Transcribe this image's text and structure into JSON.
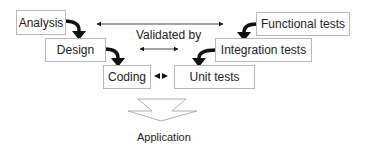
{
  "diagram": {
    "type": "v-model",
    "left_side": [
      {
        "id": "analysis",
        "label": "Analysis"
      },
      {
        "id": "design",
        "label": "Design"
      },
      {
        "id": "coding",
        "label": "Coding"
      }
    ],
    "right_side": [
      {
        "id": "functional",
        "label": "Functional tests"
      },
      {
        "id": "integration",
        "label": "Integration tests"
      },
      {
        "id": "unit",
        "label": "Unit tests"
      }
    ],
    "relation_label": "Validated by",
    "output_label": "Application",
    "edges": [
      {
        "from": "analysis",
        "to": "design",
        "style": "bold-curved-arrow"
      },
      {
        "from": "design",
        "to": "coding",
        "style": "bold-curved-arrow"
      },
      {
        "from": "functional",
        "to": "integration",
        "style": "bold-curved-arrow"
      },
      {
        "from": "integration",
        "to": "unit",
        "style": "bold-curved-arrow"
      },
      {
        "from": "analysis",
        "to": "functional",
        "style": "double-headed-thin"
      },
      {
        "from": "design",
        "to": "integration",
        "style": "double-headed-thin"
      },
      {
        "from": "coding",
        "to": "unit",
        "style": "double-headed-thin"
      },
      {
        "from": "coding+unit",
        "to": "application",
        "style": "hollow-down-arrow"
      }
    ]
  }
}
